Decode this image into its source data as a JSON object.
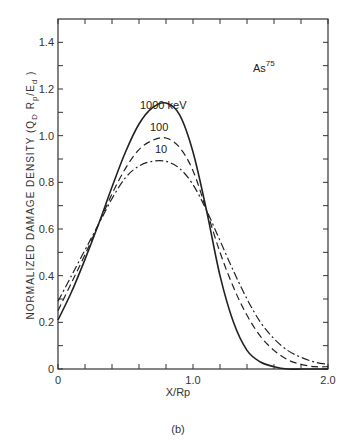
{
  "chart_data": {
    "type": "line",
    "title": "",
    "caption": "(b)",
    "xlabel": "X/Rp",
    "ylabel": "NORMALIZED DAMAGE DENSITY (Q_D R_p/E_d)",
    "ylabel_parts": {
      "main": "NORMALIZED DAMAGE DENSITY (Q",
      "sub1": "D",
      "mid": " R",
      "sub2": "p",
      "tail": "/E",
      "sub3": "d",
      "end": " )"
    },
    "annotation": {
      "text": "As",
      "sup": "75"
    },
    "xlim": [
      0,
      2.0
    ],
    "ylim": [
      0,
      1.5
    ],
    "x_ticks": [
      0,
      0.2,
      0.4,
      0.6,
      0.8,
      1.0,
      1.2,
      1.4,
      1.6,
      1.8,
      2.0
    ],
    "x_tick_labels": [
      {
        "value": 0,
        "label": "0"
      },
      {
        "value": 1.0,
        "label": "1.0"
      },
      {
        "value": 2.0,
        "label": "2.0"
      }
    ],
    "y_ticks": [
      0,
      0.1,
      0.2,
      0.3,
      0.4,
      0.5,
      0.6,
      0.7,
      0.8,
      0.9,
      1.0,
      1.1,
      1.2,
      1.3,
      1.4
    ],
    "y_tick_labels": [
      {
        "value": 0,
        "label": "0"
      },
      {
        "value": 0.2,
        "label": "0.2"
      },
      {
        "value": 0.4,
        "label": "0.4"
      },
      {
        "value": 0.6,
        "label": "0.6"
      },
      {
        "value": 0.8,
        "label": "0.8"
      },
      {
        "value": 1.0,
        "label": "1.0"
      },
      {
        "value": 1.2,
        "label": "1.2"
      },
      {
        "value": 1.4,
        "label": "1.4"
      }
    ],
    "grid": false,
    "legend": "inline labels near peaks",
    "series": [
      {
        "name": "1000 keV",
        "label": "1000 keV",
        "style": "solid",
        "x": [
          0,
          0.1,
          0.2,
          0.3,
          0.4,
          0.5,
          0.6,
          0.7,
          0.8,
          0.9,
          1.0,
          1.1,
          1.2,
          1.3,
          1.4,
          1.5,
          1.6,
          1.7,
          1.8,
          1.9,
          2.0
        ],
        "values": [
          0.21,
          0.33,
          0.47,
          0.62,
          0.78,
          0.93,
          1.05,
          1.12,
          1.14,
          1.09,
          0.93,
          0.68,
          0.4,
          0.2,
          0.08,
          0.03,
          0.01,
          0.0,
          0.0,
          0.0,
          0.0
        ]
      },
      {
        "name": "100 keV",
        "label": "100",
        "style": "dashed",
        "x": [
          0,
          0.1,
          0.2,
          0.3,
          0.4,
          0.5,
          0.6,
          0.7,
          0.8,
          0.9,
          1.0,
          1.1,
          1.2,
          1.3,
          1.4,
          1.5,
          1.6,
          1.7,
          1.8,
          1.9,
          2.0
        ],
        "values": [
          0.25,
          0.37,
          0.49,
          0.62,
          0.75,
          0.86,
          0.94,
          0.98,
          0.99,
          0.95,
          0.85,
          0.68,
          0.5,
          0.35,
          0.23,
          0.14,
          0.08,
          0.04,
          0.02,
          0.01,
          0.01
        ]
      },
      {
        "name": "10 keV",
        "label": "10",
        "style": "dash-dot",
        "x": [
          0,
          0.1,
          0.2,
          0.3,
          0.4,
          0.5,
          0.6,
          0.7,
          0.8,
          0.9,
          1.0,
          1.1,
          1.2,
          1.3,
          1.4,
          1.5,
          1.6,
          1.7,
          1.8,
          1.9,
          2.0
        ],
        "values": [
          0.29,
          0.4,
          0.51,
          0.62,
          0.73,
          0.82,
          0.87,
          0.89,
          0.89,
          0.86,
          0.79,
          0.68,
          0.55,
          0.42,
          0.3,
          0.2,
          0.13,
          0.08,
          0.05,
          0.03,
          0.02
        ]
      }
    ]
  },
  "style": {
    "axis_color": "#333333",
    "line_color": "#222222",
    "background": "#ffffff"
  }
}
